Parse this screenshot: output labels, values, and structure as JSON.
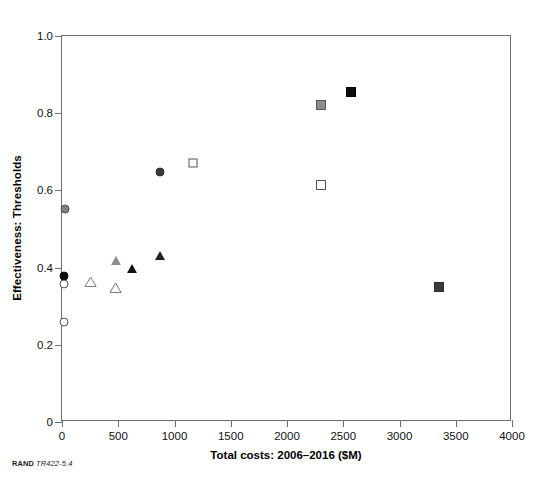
{
  "chart_data": {
    "type": "scatter",
    "title": "",
    "xlabel": "Total costs: 2006–2016 ($M)",
    "ylabel": "Effectiveness: Thresholds",
    "xlim": [
      0,
      4000
    ],
    "ylim": [
      0,
      1.0
    ],
    "xticks": [
      0,
      500,
      1000,
      1500,
      2000,
      2500,
      3000,
      3500,
      4000
    ],
    "xtick_labels": [
      "0",
      "500",
      "1000",
      "1500",
      "2000",
      "2500",
      "3000",
      "3500",
      "4000"
    ],
    "yticks": [
      0,
      0.2,
      0.4,
      0.6,
      0.8,
      1.0
    ],
    "ytick_labels": [
      "0",
      "0.2",
      "0.4",
      "0.6",
      "0.8",
      "1.0"
    ],
    "grid": false,
    "legend": "none",
    "points": [
      {
        "x": 30,
        "y": 0.553,
        "shape": "circle",
        "fill": "#808080",
        "edge": "#4d4d4d",
        "size": 9
      },
      {
        "x": 870,
        "y": 0.648,
        "shape": "circle",
        "fill": "#3a3a3a",
        "edge": "#2b2b2b",
        "size": 9
      },
      {
        "x": 15,
        "y": 0.378,
        "shape": "circle",
        "fill": "#0d0d0d",
        "edge": "#000000",
        "size": 9
      },
      {
        "x": 15,
        "y": 0.357,
        "shape": "circle",
        "fill": "#ffffff",
        "edge": "#555555",
        "size": 9
      },
      {
        "x": 15,
        "y": 0.258,
        "shape": "circle",
        "fill": "#ffffff",
        "edge": "#555555",
        "size": 9
      },
      {
        "x": 1160,
        "y": 0.672,
        "shape": "square",
        "fill": "#ffffff",
        "edge": "#555555",
        "size": 9
      },
      {
        "x": 2300,
        "y": 0.615,
        "shape": "square",
        "fill": "#ffffff",
        "edge": "#555555",
        "size": 10
      },
      {
        "x": 2300,
        "y": 0.82,
        "shape": "square",
        "fill": "#8c8c8c",
        "edge": "#595959",
        "size": 10
      },
      {
        "x": 2570,
        "y": 0.855,
        "shape": "square",
        "fill": "#0d0d0d",
        "edge": "#000000",
        "size": 10
      },
      {
        "x": 3350,
        "y": 0.35,
        "shape": "square",
        "fill": "#3a3a3a",
        "edge": "#2b2b2b",
        "size": 10
      },
      {
        "x": 250,
        "y": 0.363,
        "shape": "triangle",
        "fill": "#ffffff",
        "edge": "#777777",
        "size": 9
      },
      {
        "x": 480,
        "y": 0.347,
        "shape": "triangle",
        "fill": "#ffffff",
        "edge": "#777777",
        "size": 9
      },
      {
        "x": 480,
        "y": 0.417,
        "shape": "triangle",
        "fill": "#8c8c8c",
        "edge": "#5e5e5e",
        "size": 9
      },
      {
        "x": 620,
        "y": 0.398,
        "shape": "triangle",
        "fill": "#111111",
        "edge": "#000000",
        "size": 9
      },
      {
        "x": 870,
        "y": 0.432,
        "shape": "triangle",
        "fill": "#222222",
        "edge": "#000000",
        "size": 9
      }
    ]
  },
  "credit": {
    "source": "RAND",
    "figure_number": "TR422-5.4"
  }
}
